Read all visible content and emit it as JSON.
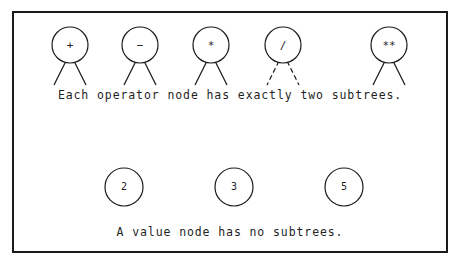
{
  "figure": {
    "background_color": "#ffffff",
    "stroke_color": "#1a1a1a",
    "width": 460,
    "height": 267
  },
  "frame": {
    "label": "figure-border",
    "x": 12,
    "y": 11,
    "width": 436,
    "height": 242,
    "border_color": "#1a1a1a",
    "border_width": 2
  },
  "captions": {
    "operators": "Each operator node has exactly two subtrees.",
    "values": "A value node has no subtrees."
  },
  "operator_nodes": [
    {
      "symbol": "+",
      "name": "plus",
      "cx": 70,
      "cy": 45,
      "r": 18,
      "leg_len": 24,
      "leg_spread": 16,
      "dashed": false
    },
    {
      "symbol": "−",
      "name": "minus",
      "cx": 140,
      "cy": 45,
      "r": 18,
      "leg_len": 24,
      "leg_spread": 16,
      "dashed": false
    },
    {
      "symbol": "*",
      "name": "times",
      "cx": 211,
      "cy": 45,
      "r": 18,
      "leg_len": 24,
      "leg_spread": 16,
      "dashed": false
    },
    {
      "symbol": "/",
      "name": "divide",
      "cx": 283,
      "cy": 45,
      "r": 18,
      "leg_len": 24,
      "leg_spread": 16,
      "dashed": true
    },
    {
      "symbol": "**",
      "name": "power",
      "cx": 389,
      "cy": 45,
      "r": 18,
      "leg_len": 24,
      "leg_spread": 16,
      "dashed": false
    }
  ],
  "value_nodes": [
    {
      "symbol": "2",
      "name": "value-two",
      "cx": 124,
      "cy": 187,
      "r": 19
    },
    {
      "symbol": "3",
      "name": "value-three",
      "cx": 234,
      "cy": 187,
      "r": 19
    },
    {
      "symbol": "5",
      "name": "value-five",
      "cx": 344,
      "cy": 187,
      "r": 19
    }
  ]
}
